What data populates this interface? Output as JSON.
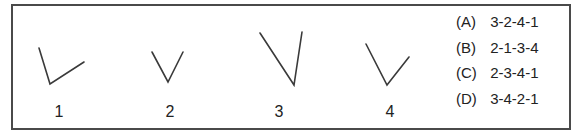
{
  "figures": [
    {
      "label": "1"
    },
    {
      "label": "2"
    },
    {
      "label": "3"
    },
    {
      "label": "4"
    }
  ],
  "options": [
    {
      "letter": "(A)",
      "sequence": "3-2-4-1"
    },
    {
      "letter": "(B)",
      "sequence": "2-1-3-4"
    },
    {
      "letter": "(C)",
      "sequence": "2-3-4-1"
    },
    {
      "letter": "(D)",
      "sequence": "3-4-2-1"
    }
  ]
}
